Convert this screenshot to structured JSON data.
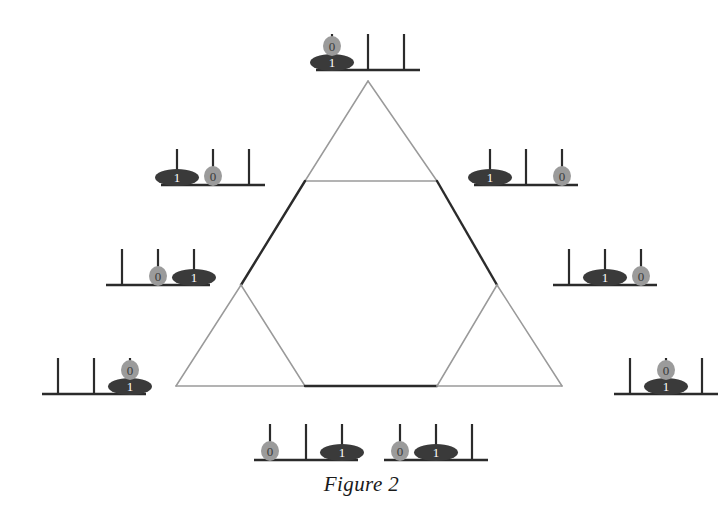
{
  "figure": {
    "caption": "Figure 2"
  },
  "colors": {
    "background": "#ffffff",
    "edge_light": "#9a9a9a",
    "edge_dark": "#2b2b2b",
    "peg": "#2b2b2b",
    "base": "#2b2b2b",
    "disk_large": "#3a3a3a",
    "disk_small": "#9b9b9b",
    "disk_large_label": "#ffffff",
    "disk_small_label": "#3a3a3a",
    "caption_text": "#1a1a1a"
  },
  "disks": {
    "large": {
      "label": "1",
      "size": "large"
    },
    "small": {
      "label": "0",
      "size": "small"
    }
  },
  "graph": {
    "node_count": 9,
    "nodes": [
      {
        "id": "n-top",
        "x": 368,
        "y": 81
      },
      {
        "id": "n-upper-left",
        "x": 305,
        "y": 181
      },
      {
        "id": "n-upper-right",
        "x": 437,
        "y": 181
      },
      {
        "id": "n-mid-left",
        "x": 241,
        "y": 285
      },
      {
        "id": "n-mid-right",
        "x": 497,
        "y": 285
      },
      {
        "id": "n-low-left",
        "x": 176,
        "y": 386
      },
      {
        "id": "n-bottom-left",
        "x": 305,
        "y": 386
      },
      {
        "id": "n-bottom-right",
        "x": 437,
        "y": 386
      },
      {
        "id": "n-low-right",
        "x": 562,
        "y": 386
      }
    ],
    "edges": [
      {
        "from": "n-top",
        "to": "n-upper-left",
        "weight": "light"
      },
      {
        "from": "n-top",
        "to": "n-upper-right",
        "weight": "light"
      },
      {
        "from": "n-upper-left",
        "to": "n-upper-right",
        "weight": "light"
      },
      {
        "from": "n-upper-left",
        "to": "n-mid-left",
        "weight": "dark"
      },
      {
        "from": "n-upper-right",
        "to": "n-mid-right",
        "weight": "dark"
      },
      {
        "from": "n-mid-left",
        "to": "n-low-left",
        "weight": "light"
      },
      {
        "from": "n-mid-left",
        "to": "n-bottom-left",
        "weight": "light"
      },
      {
        "from": "n-low-left",
        "to": "n-bottom-left",
        "weight": "light"
      },
      {
        "from": "n-bottom-left",
        "to": "n-bottom-right",
        "weight": "dark"
      },
      {
        "from": "n-mid-right",
        "to": "n-low-right",
        "weight": "light"
      },
      {
        "from": "n-mid-right",
        "to": "n-bottom-right",
        "weight": "light"
      },
      {
        "from": "n-bottom-right",
        "to": "n-low-right",
        "weight": "light"
      }
    ]
  },
  "states": [
    {
      "id": "state-top",
      "name": "state-top",
      "node": "n-top",
      "x": 310,
      "y": 28,
      "pegs": [
        [
          "1",
          "0"
        ],
        [],
        []
      ],
      "description": "both disks on peg 1"
    },
    {
      "id": "state-upper-left",
      "name": "state-upper-left",
      "node": "n-upper-left",
      "x": 155,
      "y": 143,
      "pegs": [
        [
          "1"
        ],
        [
          "0"
        ],
        []
      ],
      "description": "large disk peg 1, small disk peg 2"
    },
    {
      "id": "state-upper-right",
      "name": "state-upper-right",
      "node": "n-upper-right",
      "x": 468,
      "y": 143,
      "pegs": [
        [
          "1"
        ],
        [],
        [
          "0"
        ]
      ],
      "description": "large disk peg 1, small disk peg 3"
    },
    {
      "id": "state-mid-left",
      "name": "state-mid-left",
      "node": "n-mid-left",
      "x": 100,
      "y": 243,
      "pegs": [
        [],
        [
          "0"
        ],
        [
          "1"
        ]
      ],
      "description": "small disk peg 2, large disk peg 3"
    },
    {
      "id": "state-mid-right",
      "name": "state-mid-right",
      "node": "n-mid-right",
      "x": 547,
      "y": 243,
      "pegs": [
        [],
        [
          "1"
        ],
        [
          "0"
        ]
      ],
      "description": "large disk peg 2, small disk peg 3"
    },
    {
      "id": "state-low-left",
      "name": "state-low-left",
      "node": "n-low-left",
      "x": 36,
      "y": 352,
      "pegs": [
        [],
        [],
        [
          "1",
          "0"
        ]
      ],
      "description": "both disks on peg 3"
    },
    {
      "id": "state-low-right",
      "name": "state-low-right",
      "node": "n-low-right",
      "x": 608,
      "y": 352,
      "pegs": [
        [],
        [
          "1",
          "0"
        ],
        []
      ],
      "description": "both disks on peg 2"
    },
    {
      "id": "state-bottom-left",
      "name": "state-bottom-left",
      "node": "n-bottom-left",
      "x": 248,
      "y": 418,
      "pegs": [
        [
          "0"
        ],
        [],
        [
          "1"
        ]
      ],
      "description": "small disk peg 1, large disk peg 3"
    },
    {
      "id": "state-bottom-right",
      "name": "state-bottom-right",
      "node": "n-bottom-right",
      "x": 378,
      "y": 418,
      "pegs": [
        [
          "0"
        ],
        [
          "1"
        ],
        []
      ],
      "description": "small disk peg 1, large disk peg 2"
    }
  ]
}
